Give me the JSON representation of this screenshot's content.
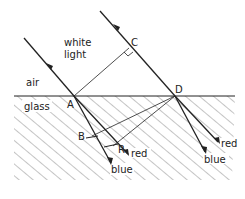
{
  "diagram": {
    "labels": {
      "white_light_1": "white",
      "white_light_2": "light",
      "air": "air",
      "glass": "glass",
      "A": "A",
      "B": "B",
      "C": "C",
      "D": "D",
      "R": "R",
      "red_left": "red",
      "blue_left": "blue",
      "red_right": "red",
      "blue_right": "blue"
    },
    "colors": {
      "line": "#222222",
      "hatch": "#555555",
      "background": "#ffffff"
    },
    "points": {
      "A": [
        74,
        96
      ],
      "C": [
        129,
        48
      ],
      "D": [
        175,
        96
      ],
      "B": [
        92,
        136
      ],
      "R": [
        113,
        146
      ]
    }
  }
}
